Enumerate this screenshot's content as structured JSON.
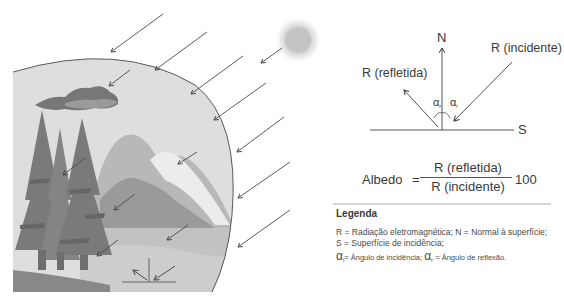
{
  "scene": {
    "description": "Illustration of solar radiation reaching Earth's surface with trees, cloud, mountains and lake",
    "colors": {
      "sky_fill": "#dcdcdc",
      "earth_outline": "#5a5a5a",
      "sun": "#c8c8c8",
      "arrow": "#4a4a4a"
    }
  },
  "diagram": {
    "normal_label": "N",
    "incident_label": "R (incidente)",
    "reflected_label": "R (refletida)",
    "surface_label": "S",
    "angle_reflected": "α",
    "angle_reflected_sub": "r",
    "angle_incident": "α",
    "angle_incident_sub": "i"
  },
  "formula": {
    "lhs": "Albedo",
    "equals": "=",
    "numerator": "R (refletida)",
    "denominator": "R (incidente)",
    "multiplier": "100"
  },
  "legend": {
    "title": "Legenda",
    "line1": "R = Radiação eletromagnética; N = Normal à superfície;",
    "line2": "S = Superfície de incidência;",
    "alpha_i": "α",
    "alpha_i_sub": "i",
    "alpha_i_text": "= Ângulo de incidência;",
    "alpha_r": "α",
    "alpha_r_sub": "r",
    "alpha_r_text": "= Ângulo de reflexão."
  }
}
